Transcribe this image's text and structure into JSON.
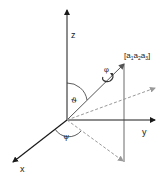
{
  "diagram": {
    "type": "3d-coordinate-system",
    "axes": {
      "z_label": "z",
      "y_label": "y",
      "x_label": "x"
    },
    "vector": {
      "label": "[a",
      "label_parts": [
        "a",
        "1",
        "a",
        "2",
        "a",
        "3"
      ],
      "label_full": "[a1 a2 a3]"
    },
    "angles": {
      "theta": "ϑ",
      "psi": "ψ",
      "phi": "φ"
    },
    "colors": {
      "axis": "#1a1a1a",
      "vector": "#555555",
      "dashed": "#999999",
      "drop_line": "#444444"
    }
  }
}
